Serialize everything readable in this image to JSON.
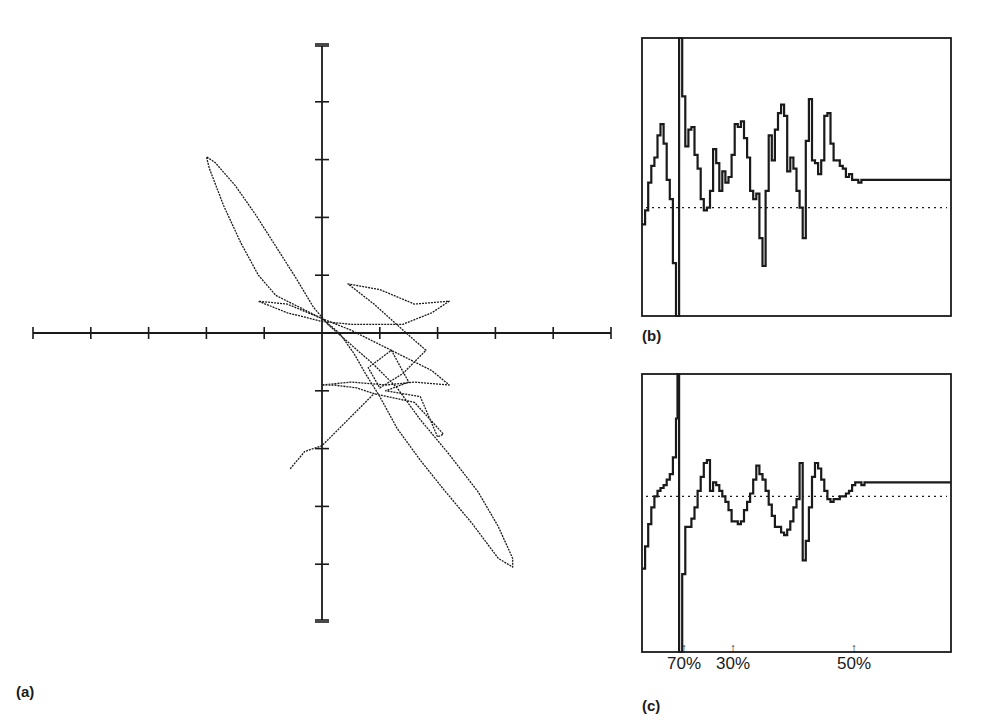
{
  "figure": {
    "panels": [
      {
        "id": "a",
        "label": "(a)"
      },
      {
        "id": "b",
        "label": "(b)"
      },
      {
        "id": "c",
        "label": "(c)"
      }
    ],
    "markers": [
      {
        "label": "70%",
        "arrow": "↑"
      },
      {
        "label": "30%",
        "arrow": "↑"
      },
      {
        "label": "50%",
        "arrow": "↑"
      }
    ],
    "colors": {
      "ink": "#1a1a1a",
      "background": "#ffffff"
    }
  },
  "chart_data": [
    {
      "panel": "(a)",
      "type": "line",
      "subtype": "phase-plane trajectory (x-y)",
      "title": "",
      "xlabel": "",
      "ylabel": "",
      "axes": "centered cross-hair axes, unlabeled ticks",
      "x_ticks": [
        -5,
        -4,
        -3,
        -2,
        -1,
        0,
        1,
        2,
        3,
        4,
        5
      ],
      "y_ticks": [
        5,
        4,
        3,
        2,
        1,
        0,
        -1,
        -2,
        -3,
        -4,
        -5
      ],
      "xlim": [
        -5,
        5
      ],
      "ylim": [
        -5,
        5
      ],
      "grid": false,
      "legend": null,
      "description": "Trajectory with an elongated loop extending to upper-left (~-2.0, 3.0) and lower-right (~3.3, -4.0), dense tangle near (0.5 to 1.5, 0 to -1.0), spur to (~-0.5, -2.4).",
      "series": [
        {
          "name": "trajectory",
          "points": [
            [
              -0.55,
              -2.35
            ],
            [
              -0.3,
              -2.05
            ],
            [
              0.0,
              -1.95
            ],
            [
              0.3,
              -1.65
            ],
            [
              0.6,
              -1.35
            ],
            [
              0.9,
              -1.05
            ],
            [
              0.6,
              -0.95
            ],
            [
              0.2,
              -0.9
            ],
            [
              0.0,
              -0.9
            ],
            [
              0.5,
              -0.85
            ],
            [
              1.1,
              -0.9
            ],
            [
              1.6,
              -0.85
            ],
            [
              2.2,
              -0.9
            ],
            [
              1.9,
              -0.65
            ],
            [
              1.5,
              -0.45
            ],
            [
              1.0,
              -0.2
            ],
            [
              0.5,
              0.05
            ],
            [
              0.0,
              0.25
            ],
            [
              -0.4,
              0.45
            ],
            [
              -0.8,
              0.65
            ],
            [
              -1.1,
              1.0
            ],
            [
              -1.4,
              1.55
            ],
            [
              -1.7,
              2.2
            ],
            [
              -1.95,
              2.85
            ],
            [
              -2.0,
              3.05
            ],
            [
              -1.85,
              2.95
            ],
            [
              -1.5,
              2.55
            ],
            [
              -1.15,
              2.05
            ],
            [
              -0.8,
              1.5
            ],
            [
              -0.45,
              0.95
            ],
            [
              -0.15,
              0.45
            ],
            [
              0.1,
              0.15
            ],
            [
              0.5,
              -0.2
            ],
            [
              0.9,
              -0.55
            ],
            [
              1.3,
              -0.95
            ],
            [
              1.7,
              -1.5
            ],
            [
              2.2,
              -2.1
            ],
            [
              2.7,
              -2.75
            ],
            [
              3.05,
              -3.35
            ],
            [
              3.3,
              -3.9
            ],
            [
              3.3,
              -4.05
            ],
            [
              3.05,
              -3.9
            ],
            [
              2.6,
              -3.3
            ],
            [
              2.1,
              -2.7
            ],
            [
              1.7,
              -2.2
            ],
            [
              1.3,
              -1.65
            ],
            [
              1.0,
              -1.1
            ],
            [
              0.75,
              -0.7
            ],
            [
              0.55,
              -0.35
            ],
            [
              0.3,
              0.0
            ],
            [
              0.0,
              0.25
            ],
            [
              -0.6,
              0.5
            ],
            [
              -1.1,
              0.55
            ],
            [
              -0.6,
              0.35
            ],
            [
              0.0,
              0.2
            ],
            [
              0.5,
              0.15
            ],
            [
              0.9,
              0.15
            ],
            [
              1.4,
              0.15
            ],
            [
              1.9,
              0.35
            ],
            [
              2.2,
              0.55
            ],
            [
              1.6,
              0.5
            ],
            [
              1.0,
              0.75
            ],
            [
              0.45,
              0.85
            ],
            [
              0.9,
              0.5
            ],
            [
              1.4,
              0.05
            ],
            [
              1.8,
              -0.3
            ],
            [
              1.4,
              -0.7
            ],
            [
              1.0,
              -0.95
            ],
            [
              0.8,
              -0.6
            ],
            [
              1.2,
              -0.3
            ],
            [
              1.5,
              -0.85
            ],
            [
              1.1,
              -1.0
            ],
            [
              1.7,
              -1.1
            ],
            [
              2.0,
              -1.8
            ],
            [
              2.1,
              -1.75
            ],
            [
              1.6,
              -1.2
            ],
            [
              0.9,
              -1.05
            ]
          ]
        }
      ]
    },
    {
      "panel": "(b)",
      "type": "line",
      "subtype": "stepped time series",
      "title": "",
      "xlabel": "time (normalized)",
      "ylabel": "",
      "xlim": [
        0,
        100
      ],
      "ylim": [
        0,
        100
      ],
      "grid": false,
      "legend": null,
      "reference_line": {
        "style": "dotted",
        "y": 39
      },
      "series": [
        {
          "name": "signal-b",
          "x": [
            0,
            1,
            2,
            3,
            4,
            5,
            6,
            7,
            8,
            9,
            10,
            11,
            11.5,
            12,
            13,
            13.5,
            14,
            15,
            16,
            17,
            18,
            19,
            20,
            21,
            22,
            23,
            24,
            25,
            26,
            27,
            28,
            29,
            30,
            31,
            32,
            33,
            34,
            35,
            36,
            37,
            38,
            39,
            40,
            41,
            42,
            43,
            44,
            45,
            46,
            47,
            48,
            49,
            50,
            51,
            52,
            53,
            54,
            55,
            56,
            57,
            58,
            59,
            60,
            61,
            62,
            63,
            64,
            65,
            66,
            67,
            68,
            69,
            70,
            71,
            72,
            73,
            74,
            75,
            76,
            77,
            78,
            79,
            80,
            82,
            85,
            90,
            95,
            100
          ],
          "values": [
            33,
            38,
            48,
            54,
            57,
            65,
            69,
            62,
            49,
            42,
            19,
            0,
            0,
            100,
            79,
            79,
            61,
            67,
            68,
            58,
            53,
            42,
            38,
            39,
            45,
            60,
            55,
            45,
            52,
            48,
            50,
            58,
            69,
            68,
            70,
            64,
            57,
            45,
            42,
            44,
            28,
            18,
            45,
            65,
            56,
            67,
            73,
            76,
            72,
            52,
            57,
            53,
            45,
            39,
            28,
            63,
            78,
            56,
            55,
            51,
            56,
            72,
            73,
            62,
            56,
            56,
            54,
            53,
            50,
            51,
            49,
            49,
            48,
            49,
            49,
            49,
            49,
            49,
            49,
            49,
            49,
            49,
            49,
            49,
            49,
            49,
            49,
            49
          ]
        }
      ]
    },
    {
      "panel": "(c)",
      "type": "line",
      "subtype": "stepped time series",
      "title": "",
      "xlabel": "time (normalized)",
      "ylabel": "",
      "xlim": [
        0,
        100
      ],
      "ylim": [
        0,
        100
      ],
      "grid": false,
      "legend": null,
      "reference_line": {
        "style": "dotted",
        "y": 56
      },
      "annotations": [
        {
          "text": "70%",
          "x": 13,
          "type": "arrow-up"
        },
        {
          "text": "30%",
          "x": 25,
          "type": "arrow-up"
        },
        {
          "text": "50%",
          "x": 66,
          "type": "arrow-up"
        }
      ],
      "series": [
        {
          "name": "signal-c",
          "x": [
            0,
            1,
            2,
            3,
            4,
            5,
            6,
            7,
            8,
            9,
            10,
            11,
            11.5,
            12,
            13,
            13.5,
            14,
            15,
            16,
            17,
            18,
            19,
            20,
            21,
            22,
            23,
            24,
            25,
            26,
            27,
            28,
            29,
            30,
            31,
            32,
            33,
            34,
            35,
            36,
            37,
            38,
            39,
            40,
            41,
            42,
            43,
            44,
            45,
            46,
            47,
            48,
            49,
            50,
            51,
            52,
            53,
            54,
            55,
            56,
            57,
            58,
            59,
            60,
            61,
            62,
            63,
            64,
            65,
            66,
            67,
            68,
            69,
            70,
            71,
            72,
            73,
            74,
            75,
            76,
            77,
            78,
            79,
            80,
            82,
            85,
            90,
            95,
            100
          ],
          "values": [
            30,
            38,
            46,
            52,
            56,
            58,
            59,
            60,
            62,
            64,
            70,
            84,
            100,
            0,
            28,
            28,
            45,
            45,
            48,
            52,
            58,
            63,
            68,
            69,
            58,
            61,
            60,
            58,
            56,
            54,
            51,
            47,
            47,
            46,
            47,
            51,
            54,
            57,
            62,
            67,
            64,
            62,
            58,
            53,
            49,
            45,
            45,
            43,
            42,
            44,
            47,
            52,
            55,
            68,
            33,
            40,
            52,
            63,
            68,
            66,
            62,
            58,
            55,
            54,
            55,
            55,
            56,
            56,
            57,
            58,
            60,
            61,
            61,
            60,
            61,
            61,
            61,
            61,
            61,
            61,
            61,
            61,
            61,
            61,
            61,
            61,
            61,
            61
          ]
        }
      ]
    }
  ]
}
